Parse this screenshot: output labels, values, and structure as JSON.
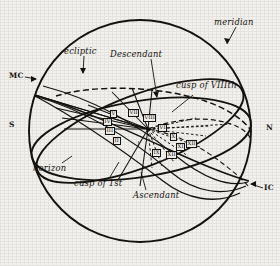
{
  "figure": {
    "ink_color": "#15130f",
    "paper_color": "#f4f2ee"
  },
  "cardinal_points": [
    {
      "key": "mc",
      "label": "MC",
      "desc": "medium-coeli-upper-left"
    },
    {
      "key": "ic",
      "label": "IC",
      "desc": "imum-coeli-lower-right"
    },
    {
      "key": "s",
      "label": "S",
      "desc": "south-left"
    },
    {
      "key": "n",
      "label": "N",
      "desc": "north-right"
    }
  ],
  "annotations": [
    {
      "key": "meridian",
      "label": "meridian"
    },
    {
      "key": "ecliptic",
      "label": "ecliptic"
    },
    {
      "key": "horizon",
      "label": "horizon"
    },
    {
      "key": "descendant",
      "label": "Descendant"
    },
    {
      "key": "ascendant",
      "label": "Ascendant"
    },
    {
      "key": "cusp_first",
      "label": "cusp of 1st"
    },
    {
      "key": "cusp_eighth",
      "label": "cusp of VIIIth"
    }
  ],
  "houses": [
    {
      "key": "h_V",
      "label": "V"
    },
    {
      "key": "h_IV",
      "label": "IV"
    },
    {
      "key": "h_III",
      "label": "III"
    },
    {
      "key": "h_II",
      "label": "II"
    },
    {
      "key": "h_VII",
      "label": "VII"
    },
    {
      "key": "h_VIII",
      "label": "VIII"
    },
    {
      "key": "h_VI",
      "label": "VI"
    },
    {
      "key": "h_I",
      "label": "I"
    },
    {
      "key": "h_X",
      "label": "X"
    },
    {
      "key": "h_XI",
      "label": "XI"
    },
    {
      "key": "h_XII",
      "label": "XII"
    },
    {
      "key": "h_IX",
      "label": "IX"
    },
    {
      "key": "h_XIIb",
      "label": "XII"
    }
  ]
}
